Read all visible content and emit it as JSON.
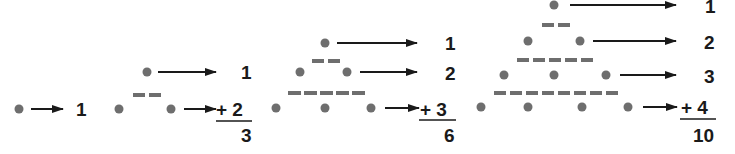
{
  "colors": {
    "dot": "#6e6e6e",
    "dash": "#6e6e6e",
    "arrow": "#1a1a1a",
    "text": "#1a1a1a",
    "background": "#ffffff"
  },
  "figures": [
    {
      "id": "T1",
      "rows": [
        {
          "dots": 1,
          "label": "1"
        }
      ],
      "sum_prefix": "",
      "total": ""
    },
    {
      "id": "T2",
      "rows": [
        {
          "dots": 1,
          "label": "1"
        },
        {
          "dots": 2,
          "label": "2"
        }
      ],
      "sum_prefix": "+",
      "total": "3"
    },
    {
      "id": "T3",
      "rows": [
        {
          "dots": 1,
          "label": "1"
        },
        {
          "dots": 2,
          "label": "2"
        },
        {
          "dots": 3,
          "label": "3"
        }
      ],
      "sum_prefix": "+",
      "total": "6"
    },
    {
      "id": "T4",
      "rows": [
        {
          "dots": 1,
          "label": "1"
        },
        {
          "dots": 2,
          "label": "2"
        },
        {
          "dots": 3,
          "label": "3"
        },
        {
          "dots": 4,
          "label": "4"
        }
      ],
      "sum_prefix": "+",
      "total": "10"
    }
  ],
  "labels": {
    "f1_r1": "1",
    "f2_r1": "1",
    "f2_r2": "+ 2",
    "f2_total": "3",
    "f3_r1": "1",
    "f3_r2": "2",
    "f3_r3": "+ 3",
    "f3_total": "6",
    "f4_r1": "1",
    "f4_r2": "2",
    "f4_r3": "3",
    "f4_r4": "+ 4",
    "f4_total": "10"
  }
}
